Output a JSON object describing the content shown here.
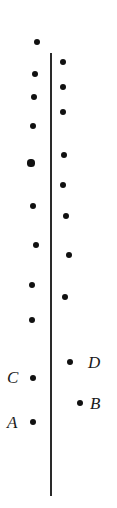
{
  "figure": {
    "title": "",
    "width": 117,
    "height": 508,
    "background_color": "#ffffff",
    "dot_color": "#111111",
    "line_color": "#2a2a2a",
    "label_color": "#1a1a1a"
  },
  "axis": {
    "name": "vertical-reference-line",
    "x": 51,
    "y_top": 53,
    "y_bottom": 496,
    "thickness": 1.5
  },
  "labels": [
    {
      "text": "C",
      "x": 7,
      "y": 369
    },
    {
      "text": "A",
      "x": 7,
      "y": 414
    },
    {
      "text": "D",
      "x": 88,
      "y": 354
    },
    {
      "text": "B",
      "x": 90,
      "y": 395
    }
  ],
  "chart_data": {
    "type": "scatter",
    "title": "",
    "xlabel": "",
    "ylabel": "",
    "grid": false,
    "legend": "none",
    "axis_line_x": 51,
    "series": [
      {
        "name": "left-column",
        "side": "left",
        "color": "#111111",
        "points": [
          {
            "x": 37,
            "y": 42,
            "r": 3.4
          },
          {
            "x": 35,
            "y": 74,
            "r": 3.4
          },
          {
            "x": 34,
            "y": 97,
            "r": 3.4
          },
          {
            "x": 33,
            "y": 126,
            "r": 3.4
          },
          {
            "x": 31,
            "y": 163,
            "r": 3.6
          },
          {
            "x": 33,
            "y": 206,
            "r": 3.4
          },
          {
            "x": 36,
            "y": 245,
            "r": 3.4
          },
          {
            "x": 32,
            "y": 285,
            "r": 3.4
          },
          {
            "x": 32,
            "y": 320,
            "r": 3.4
          },
          {
            "x": 33,
            "y": 378,
            "r": 3.4,
            "label": "C"
          },
          {
            "x": 33,
            "y": 422,
            "r": 3.4,
            "label": "A"
          }
        ]
      },
      {
        "name": "right-column",
        "side": "right",
        "color": "#111111",
        "points": [
          {
            "x": 63,
            "y": 62,
            "r": 3.4
          },
          {
            "x": 63,
            "y": 87,
            "r": 3.2
          },
          {
            "x": 63,
            "y": 112,
            "r": 3.4
          },
          {
            "x": 64,
            "y": 155,
            "r": 3.4
          },
          {
            "x": 63,
            "y": 185,
            "r": 3.2
          },
          {
            "x": 66,
            "y": 216,
            "r": 3.4
          },
          {
            "x": 69,
            "y": 255,
            "r": 3.2
          },
          {
            "x": 65,
            "y": 297,
            "r": 3.4
          },
          {
            "x": 70,
            "y": 362,
            "r": 3.4,
            "label": "D"
          },
          {
            "x": 80,
            "y": 403,
            "r": 3.2,
            "label": "B"
          }
        ]
      }
    ]
  }
}
